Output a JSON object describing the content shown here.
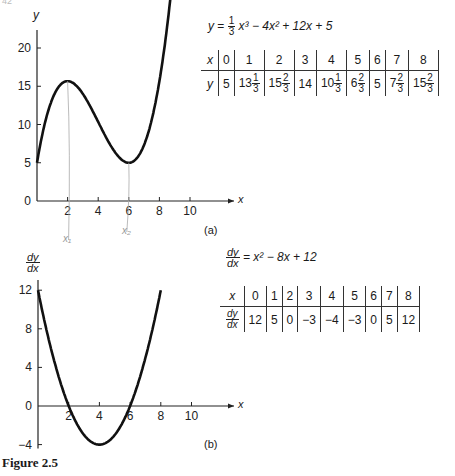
{
  "page": {
    "number": "42"
  },
  "figure": {
    "caption": "Figure 2.5"
  },
  "panel_a": {
    "label": "(a)",
    "y_axis_label": "y",
    "x_axis_label": "x",
    "equation": {
      "lhs": "y",
      "coef_num": "1",
      "coef_den": "3",
      "rest": "x³ − 4x² + 12x + 5"
    },
    "table": {
      "x_header": "x",
      "y_header": "y",
      "x_values": [
        "0",
        "1",
        "2",
        "3",
        "4",
        "5",
        "6",
        "7",
        "8"
      ],
      "y_values": [
        {
          "whole": "5"
        },
        {
          "whole": "13",
          "num": "1",
          "den": "3"
        },
        {
          "whole": "15",
          "num": "2",
          "den": "3"
        },
        {
          "whole": "14"
        },
        {
          "whole": "10",
          "num": "1",
          "den": "3"
        },
        {
          "whole": "6",
          "num": "2",
          "den": "3"
        },
        {
          "whole": "5"
        },
        {
          "whole": "7",
          "num": "2",
          "den": "3"
        },
        {
          "whole": "15",
          "num": "2",
          "den": "3"
        }
      ]
    },
    "annotations": [
      "x₁",
      "x₂"
    ]
  },
  "panel_b": {
    "label": "(b)",
    "y_axis_label_num": "dy",
    "y_axis_label_den": "dx",
    "x_axis_label": "x",
    "equation": {
      "lhs_num": "dy",
      "lhs_den": "dx",
      "rest": "= x² − 8x + 12"
    },
    "table": {
      "x_header": "x",
      "y_header_num": "dy",
      "y_header_den": "dx",
      "x_values": [
        "0",
        "1",
        "2",
        "3",
        "4",
        "5",
        "6",
        "7",
        "8"
      ],
      "y_values": [
        "12",
        "5",
        "0",
        "−3",
        "−4",
        "−3",
        "0",
        "5",
        "12"
      ]
    }
  },
  "chart_data": [
    {
      "type": "line",
      "title": "(a)",
      "function": "y = (1/3)x^3 - 4x^2 + 12x + 5",
      "xlabel": "x",
      "ylabel": "y",
      "x": [
        0,
        1,
        2,
        3,
        4,
        5,
        6,
        7,
        8
      ],
      "values": [
        5,
        13.33,
        15.67,
        14,
        10.33,
        6.67,
        5,
        7.67,
        15.67
      ],
      "xticks": [
        0,
        2,
        4,
        6,
        8,
        10
      ],
      "yticks": [
        0,
        5,
        10,
        15,
        20
      ],
      "xlim": [
        0,
        13.5
      ],
      "ylim": [
        0,
        22
      ],
      "grid": false,
      "annotations": [
        "local max at x=2 (x₁)",
        "local min at x=6 (x₂)"
      ]
    },
    {
      "type": "line",
      "title": "(b)",
      "function": "dy/dx = x^2 - 8x + 12",
      "xlabel": "x",
      "ylabel": "dy/dx",
      "x": [
        0,
        1,
        2,
        3,
        4,
        5,
        6,
        7,
        8
      ],
      "values": [
        12,
        5,
        0,
        -3,
        -4,
        -3,
        0,
        5,
        12
      ],
      "xticks": [
        0,
        2,
        4,
        6,
        8,
        10
      ],
      "yticks": [
        -4,
        0,
        4,
        8,
        12
      ],
      "xlim": [
        0,
        13.5
      ],
      "ylim": [
        -4,
        12
      ],
      "grid": false
    }
  ]
}
